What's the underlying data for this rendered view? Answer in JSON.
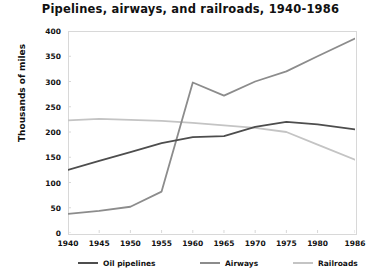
{
  "chart_data": {
    "type": "line",
    "title": "Pipelines, airways, and railroads, 1940-1986",
    "xlabel": "",
    "ylabel": "Thousands of miles",
    "categories": [
      "1940",
      "1945",
      "1950",
      "1955",
      "1960",
      "1965",
      "1970",
      "1975",
      "1980",
      "1986"
    ],
    "x": [
      1940,
      1945,
      1950,
      1955,
      1960,
      1965,
      1970,
      1975,
      1980,
      1986
    ],
    "xlim": [
      1940,
      1986
    ],
    "ylim": [
      0,
      400
    ],
    "yticks": [
      "400",
      "350",
      "300",
      "250",
      "200",
      "150",
      "100",
      "50",
      "0"
    ],
    "ytick_values": [
      400,
      350,
      300,
      250,
      200,
      150,
      100,
      50,
      0
    ],
    "grid": false,
    "legend_position": "bottom",
    "series": [
      {
        "name": "Oil pipelines",
        "color": "#4d4d4d",
        "values": [
          125,
          143,
          160,
          178,
          190,
          192,
          210,
          220,
          215,
          205
        ]
      },
      {
        "name": "Airways",
        "color": "#8c8c8c",
        "values": [
          38,
          44,
          52,
          82,
          298,
          272,
          300,
          320,
          350,
          385
        ]
      },
      {
        "name": "Railroads",
        "color": "#c4c4c4",
        "values": [
          223,
          226,
          224,
          222,
          218,
          213,
          208,
          200,
          175,
          145
        ]
      }
    ]
  }
}
